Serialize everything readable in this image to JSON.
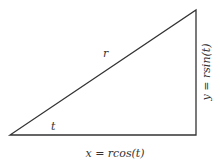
{
  "diagram": {
    "hypotenuse_label": "r",
    "angle_label": "t",
    "base_label": "x = rcos(t)",
    "height_label": "y = rsin(t)",
    "stroke_color": "#333333",
    "vertices": {
      "origin": [
        10,
        135
      ],
      "right_angle": [
        196,
        135
      ],
      "apex": [
        196,
        10
      ]
    }
  }
}
